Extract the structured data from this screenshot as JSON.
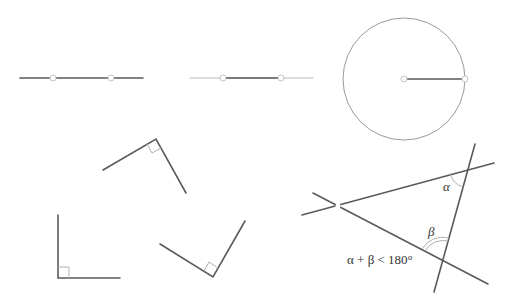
{
  "figure": {
    "panels": [
      {
        "id": "line-through-two-points",
        "kind": "line",
        "points": 2
      },
      {
        "id": "segment-extended",
        "kind": "segment-extension",
        "points": 2
      },
      {
        "id": "circle-from-radius",
        "kind": "circle",
        "points": 2
      },
      {
        "id": "right-angles-equal",
        "kind": "right-angles",
        "count": 3
      },
      {
        "id": "parallel-postulate",
        "kind": "parallel-postulate"
      }
    ],
    "labels": {
      "alpha": "α",
      "beta": "β",
      "inequality": "α + β < 180°"
    }
  },
  "colors": {
    "line": "#5a5a5a",
    "faint_line": "#b8b8b8",
    "circle": "#9a9a9a",
    "marker": "#b0b0b0",
    "background": "#ffffff"
  }
}
